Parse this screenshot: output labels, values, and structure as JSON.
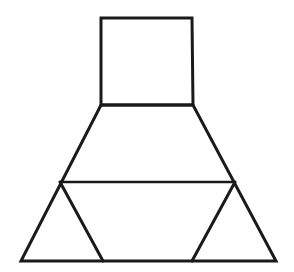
{
  "figure": {
    "canvas": {
      "width": 294,
      "height": 272
    },
    "style": {
      "background_color": "#ffffff",
      "stroke_color": "#1a1a1a",
      "fill_color": "#ffffff",
      "stroke_width": 3,
      "thin_stroke_width": 2.6
    },
    "points": {
      "square_top_left": {
        "x": 101,
        "y": 18
      },
      "square_top_right": {
        "x": 192,
        "y": 18
      },
      "square_bottom_right": {
        "x": 193,
        "y": 105
      },
      "square_bottom_left": {
        "x": 101,
        "y": 105
      },
      "base_left": {
        "x": 21,
        "y": 261
      },
      "base_right": {
        "x": 276,
        "y": 261
      },
      "divider_left": {
        "x": 60,
        "y": 182
      },
      "divider_right": {
        "x": 235,
        "y": 182
      },
      "inner_left_foot": {
        "x": 103,
        "y": 261
      },
      "inner_right_foot": {
        "x": 192,
        "y": 261
      }
    },
    "shapes": [
      {
        "name": "square",
        "kind": "quadrilateral",
        "description": "Upper square / neck of the figure",
        "vertices": "101,18 192,18 193,105 101,105"
      },
      {
        "name": "trapezoid",
        "kind": "quadrilateral",
        "description": "Lower trapezoid flaring from square base to ground line",
        "vertices": "101,105 193,105 276,261 21,261"
      },
      {
        "name": "divider-line",
        "kind": "segment",
        "description": "Horizontal line crossing the trapezoid",
        "vertices": "60,182 235,182"
      },
      {
        "name": "left-inner-leg",
        "kind": "segment",
        "description": "Slanted segment forming left inner triangle",
        "vertices": "60,182 103,261"
      },
      {
        "name": "right-inner-leg",
        "kind": "segment",
        "description": "Slanted segment forming right inner triangle",
        "vertices": "235,182 192,261"
      }
    ],
    "regions": [
      {
        "name": "square-region",
        "label": "square"
      },
      {
        "name": "upper-trapezoid-region",
        "label": "upper trapezoid"
      },
      {
        "name": "left-corner-triangle",
        "label": "left triangle"
      },
      {
        "name": "center-trapezoid-region",
        "label": "center trapezoid"
      },
      {
        "name": "right-corner-triangle",
        "label": "right triangle"
      }
    ]
  }
}
